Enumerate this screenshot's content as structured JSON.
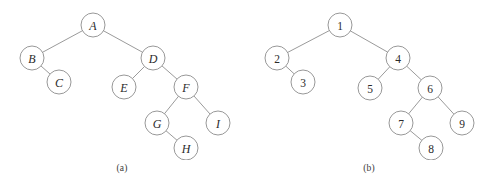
{
  "figure": {
    "background_color": "#ffffff",
    "stroke_color": "#8c8c8c",
    "text_color": "#2b2b2b",
    "node_radius": 12
  },
  "panels": [
    {
      "id": "a",
      "caption": "(a)",
      "label_style": "italic-label",
      "nodes": [
        {
          "id": "A",
          "label": "A",
          "cx": 93,
          "cy": 25
        },
        {
          "id": "B",
          "label": "B",
          "cx": 32,
          "cy": 58
        },
        {
          "id": "C",
          "label": "C",
          "cx": 59,
          "cy": 82
        },
        {
          "id": "D",
          "label": "D",
          "cx": 153,
          "cy": 58
        },
        {
          "id": "E",
          "label": "E",
          "cx": 124,
          "cy": 87
        },
        {
          "id": "F",
          "label": "F",
          "cx": 186,
          "cy": 87
        },
        {
          "id": "G",
          "label": "G",
          "cx": 157,
          "cy": 123
        },
        {
          "id": "I",
          "label": "I",
          "cx": 218,
          "cy": 123
        },
        {
          "id": "H",
          "label": "H",
          "cx": 186,
          "cy": 148
        }
      ],
      "edges": [
        {
          "from": "A",
          "to": "B"
        },
        {
          "from": "A",
          "to": "D"
        },
        {
          "from": "B",
          "to": "C"
        },
        {
          "from": "D",
          "to": "E"
        },
        {
          "from": "D",
          "to": "F"
        },
        {
          "from": "F",
          "to": "G"
        },
        {
          "from": "F",
          "to": "I"
        },
        {
          "from": "G",
          "to": "H"
        }
      ]
    },
    {
      "id": "b",
      "caption": "(b)",
      "label_style": "numeric-label",
      "nodes": [
        {
          "id": "n1",
          "label": "1",
          "cx": 94,
          "cy": 25
        },
        {
          "id": "n2",
          "label": "2",
          "cx": 31,
          "cy": 58
        },
        {
          "id": "n3",
          "label": "3",
          "cx": 57,
          "cy": 82
        },
        {
          "id": "n4",
          "label": "4",
          "cx": 152,
          "cy": 58
        },
        {
          "id": "n5",
          "label": "5",
          "cx": 124,
          "cy": 88
        },
        {
          "id": "n6",
          "label": "6",
          "cx": 184,
          "cy": 88
        },
        {
          "id": "n7",
          "label": "7",
          "cx": 155,
          "cy": 123
        },
        {
          "id": "n9",
          "label": "9",
          "cx": 216,
          "cy": 123
        },
        {
          "id": "n8",
          "label": "8",
          "cx": 185,
          "cy": 148
        }
      ],
      "edges": [
        {
          "from": "n1",
          "to": "n2"
        },
        {
          "from": "n1",
          "to": "n4"
        },
        {
          "from": "n2",
          "to": "n3"
        },
        {
          "from": "n4",
          "to": "n5"
        },
        {
          "from": "n4",
          "to": "n6"
        },
        {
          "from": "n6",
          "to": "n7"
        },
        {
          "from": "n6",
          "to": "n9"
        },
        {
          "from": "n7",
          "to": "n8"
        }
      ]
    }
  ]
}
